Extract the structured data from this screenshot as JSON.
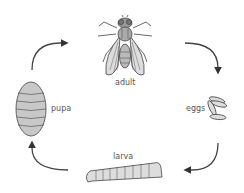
{
  "diagram": {
    "type": "life-cycle",
    "direction": "clockwise",
    "stages": [
      {
        "id": "adult",
        "label": "adult"
      },
      {
        "id": "eggs",
        "label": "eggs"
      },
      {
        "id": "larva",
        "label": "larva"
      },
      {
        "id": "pupa",
        "label": "pupa"
      }
    ],
    "arrows": [
      {
        "from": "pupa",
        "to": "adult"
      },
      {
        "from": "adult",
        "to": "eggs"
      },
      {
        "from": "eggs",
        "to": "larva"
      },
      {
        "from": "larva",
        "to": "pupa"
      }
    ],
    "colors": {
      "line": "#444444",
      "fill": "#c8c8c8",
      "label": "#555555"
    }
  }
}
